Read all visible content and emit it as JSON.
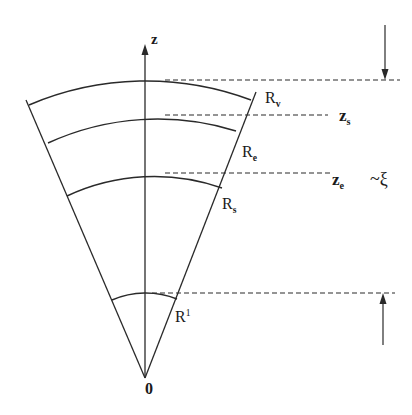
{
  "diagram": {
    "type": "conical wedge geometry with radial shells",
    "colors": {
      "ink": "#2a2a2a",
      "background": "#ffffff"
    },
    "apex_label": "0",
    "axis_label": "z",
    "radii_labels": [
      {
        "base": "R",
        "sub": "v"
      },
      {
        "base": "R",
        "sub": "e"
      },
      {
        "base": "R",
        "sub": "s"
      },
      {
        "base": "R",
        "sup": "1"
      }
    ],
    "level_labels": [
      {
        "base": "z",
        "sub": "s"
      },
      {
        "base": "z",
        "sub": "e"
      }
    ],
    "scale_annotation": "~ξ",
    "arrows": [
      {
        "direction": "down",
        "meaning": "upper boundary marker"
      },
      {
        "direction": "up",
        "meaning": "lower boundary marker"
      }
    ]
  }
}
